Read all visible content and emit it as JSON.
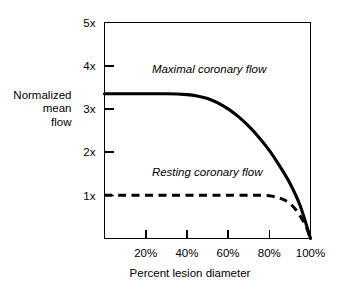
{
  "chart_data": {
    "type": "line",
    "title": "",
    "subtitle": "",
    "xlabel": "Percent lesion diameter",
    "ylabel": "Normalized mean flow",
    "ylabel_lines": [
      "Normalized",
      "mean",
      "flow"
    ],
    "xlim": [
      0,
      100
    ],
    "ylim": [
      0,
      5
    ],
    "grid": false,
    "legend_position": "inline-annotation",
    "x_tick_labels": [
      "20%",
      "40%",
      "60%",
      "80%",
      "100%"
    ],
    "x_tick_values": [
      20,
      40,
      60,
      80,
      100
    ],
    "y_tick_labels": [
      "1x",
      "2x",
      "3x",
      "4x",
      "5x"
    ],
    "y_tick_values": [
      1,
      2,
      3,
      4,
      5
    ],
    "series": [
      {
        "name": "Maximal coronary flow",
        "style": "solid",
        "x": [
          0,
          10,
          20,
          30,
          40,
          45,
          50,
          55,
          60,
          65,
          70,
          75,
          80,
          85,
          90,
          95,
          100
        ],
        "values": [
          3.35,
          3.35,
          3.35,
          3.35,
          3.33,
          3.3,
          3.24,
          3.14,
          3.0,
          2.82,
          2.6,
          2.34,
          2.04,
          1.68,
          1.28,
          0.76,
          0.0
        ]
      },
      {
        "name": "Resting coronary flow",
        "style": "dashed",
        "x": [
          0,
          10,
          20,
          30,
          40,
          50,
          60,
          70,
          75,
          80,
          84,
          87,
          90,
          93,
          96,
          98,
          100
        ],
        "values": [
          1.0,
          1.0,
          1.0,
          1.0,
          1.0,
          1.0,
          1.0,
          1.0,
          1.0,
          0.99,
          0.95,
          0.9,
          0.81,
          0.66,
          0.44,
          0.26,
          0.0
        ]
      }
    ],
    "annotations": [
      {
        "text": "Maximal coronary flow",
        "x": 23,
        "y": 3.82
      },
      {
        "text": "Resting coronary flow",
        "x": 23,
        "y": 1.44
      }
    ],
    "colors": {
      "axis": "#000000",
      "maximal_flow": "#000000",
      "resting_flow": "#000000",
      "background": "#ffffff"
    }
  }
}
